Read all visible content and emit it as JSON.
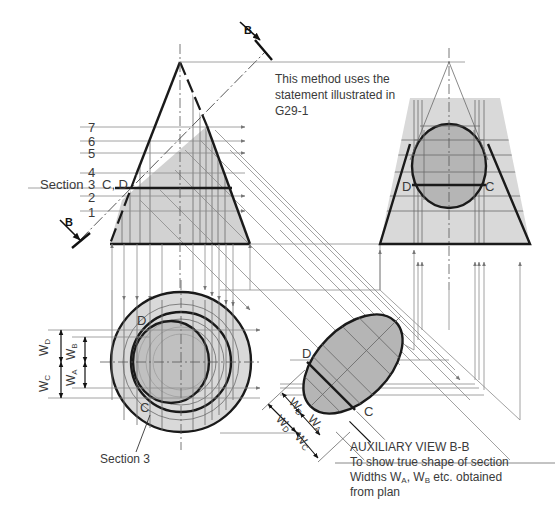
{
  "diagram": {
    "type": "orthographic-projection-auxiliary-view",
    "colors": {
      "background": "#ffffff",
      "section_fill": "#b5b5b5",
      "body_fill": "#d9d9d9",
      "outline": "#1a1a1a",
      "construction_line": "#8a8a8a",
      "text": "#3a3a3a"
    }
  },
  "notes": {
    "method": {
      "line1": "This method uses the",
      "line2": "statement illustrated in",
      "line3": "G29-1"
    },
    "auxiliary": {
      "title": "AUXILIARY VIEW B-B",
      "line1": "To show true shape of section",
      "line2_prefix": "Widths W",
      "line2_sub_a": "A",
      "line2_mid": ", W",
      "line2_sub_b": "B",
      "line2_suffix": " etc. obtained",
      "line3": "from plan"
    }
  },
  "cutting_plane": {
    "label_top": "B",
    "label_bottom": "B"
  },
  "elevation": {
    "section_levels": [
      "7",
      "6",
      "5",
      "4",
      "3",
      "2",
      "1"
    ],
    "section_label": "Section",
    "section_points": "C, D"
  },
  "end_view": {
    "point_left": "D",
    "point_right": "C"
  },
  "plan": {
    "point_top": "D",
    "point_bottom": "C",
    "leader_label": "Section 3",
    "widths": {
      "w": "W",
      "d": "D",
      "b": "B",
      "c": "C",
      "a": "A"
    }
  },
  "aux_view": {
    "point_top": "D",
    "point_bottom": "C",
    "widths": {
      "w": "W",
      "b": "B",
      "a": "A",
      "d": "D",
      "c": "C"
    }
  }
}
